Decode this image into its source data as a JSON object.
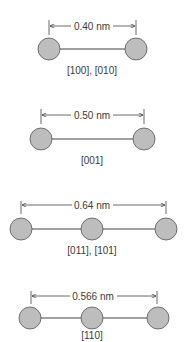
{
  "colors": {
    "atom_fill": "#bdbdbd",
    "atom_stroke": "#555555",
    "line": "#444444",
    "text": "#3a3a3a"
  },
  "diagrams": [
    {
      "distance": "0.40 nm",
      "directions": "[100], [010]",
      "atoms": 2
    },
    {
      "distance": "0.50 nm",
      "directions": "[001]",
      "atoms": 2
    },
    {
      "distance": "0.64 nm",
      "directions": "[011], [101]",
      "atoms": 3
    },
    {
      "distance": "0.566 nm",
      "directions": "[110]",
      "atoms": 3
    }
  ]
}
